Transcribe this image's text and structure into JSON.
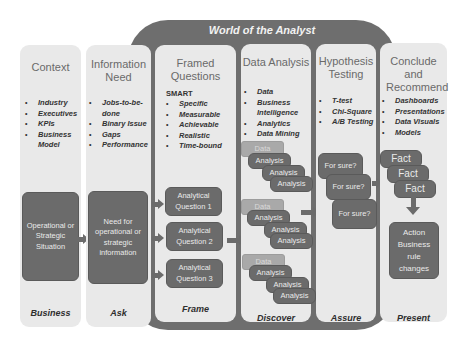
{
  "world": {
    "title": "World of the Analyst"
  },
  "columns": {
    "context": {
      "title": "Context",
      "bullets": [
        "Industry",
        "Executives",
        "KPIs",
        "Business Model"
      ],
      "box": "Operational or Strategic Situation",
      "footer": "Business"
    },
    "information_need": {
      "title": "Information Need",
      "bullets": [
        "Jobs-to-be-done",
        "Binary Issue",
        "Gaps",
        "Performance"
      ],
      "box": "Need for operational or strategic information",
      "footer": "Ask"
    },
    "framed_questions": {
      "title": "Framed Questions",
      "smart_label": "SMART",
      "bullets": [
        "Specific",
        "Measurable",
        "Achievable",
        "Realistic",
        "Time-bound"
      ],
      "boxes": [
        "Analytical Question 1",
        "Analytical Question 2",
        "Analytical Question 3"
      ],
      "footer": "Frame"
    },
    "data_analysis": {
      "title": "Data Analysis",
      "bullets": [
        "Data",
        "Business Intelligence",
        "Analytics",
        "Data Mining"
      ],
      "stacks": [
        {
          "data": "Data",
          "analysis": [
            "Analysis",
            "Analysis",
            "Analysis"
          ]
        },
        {
          "data": "Data",
          "analysis": [
            "Analysis",
            "Analysis",
            "Analysis"
          ]
        },
        {
          "data": "Data",
          "analysis": [
            "Analysis",
            "Analysis",
            "Analysis"
          ]
        }
      ],
      "footer": "Discover"
    },
    "hypothesis_testing": {
      "title": "Hypothesis Testing",
      "bullets": [
        "T-test",
        "Chi-Square",
        "A/B Testing"
      ],
      "boxes": [
        "For sure?",
        "For sure?",
        "For sure?"
      ],
      "footer": "Assure"
    },
    "conclude": {
      "title": "Conclude and Recommend",
      "bullets": [
        "Dashboards",
        "Presentations",
        "Data Visuals",
        "Models"
      ],
      "facts": [
        "Fact",
        "Fact",
        "Fact"
      ],
      "action": "Action Business rule changes",
      "footer": "Present"
    }
  },
  "colors": {
    "world_bg": "#6e6e6e",
    "column_bg": "#e9e9e9",
    "box_bg": "#6b6b6b",
    "data_box_bg": "#a9a9a9"
  }
}
